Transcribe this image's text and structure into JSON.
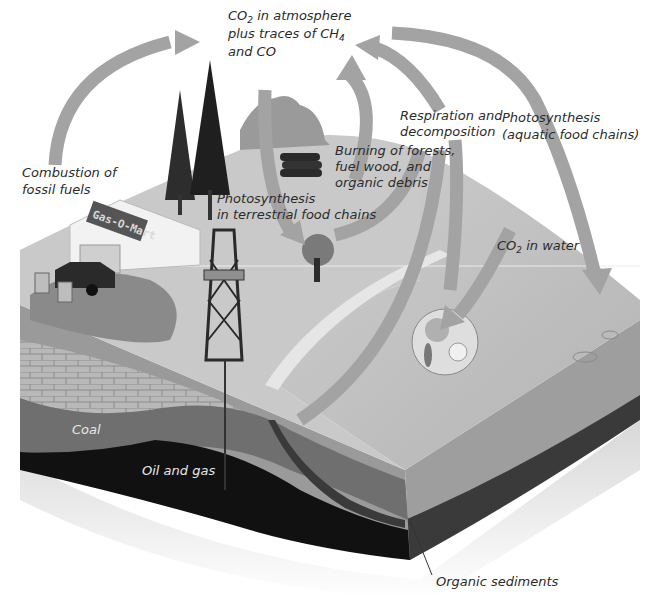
{
  "labels": {
    "atmosphere": {
      "line1_main": "CO",
      "line1_sub": "2",
      "line1_rest": " in atmosphere",
      "line2_main": "plus traces of CH",
      "line2_sub": "4",
      "line3": "and CO"
    },
    "combustion": {
      "line1": "Combustion of",
      "line2": "fossil fuels"
    },
    "burning": {
      "line1": "Burning of forests,",
      "line2": "fuel wood, and",
      "line3": "organic debris"
    },
    "respiration": {
      "line1": "Respiration and",
      "line2": "decomposition"
    },
    "photosynthesis_aquatic": {
      "line1": "Photosynthesis",
      "line2": "(aquatic food chains)"
    },
    "photosynthesis_terrestrial": {
      "line1": "Photosynthesis",
      "line2": "in terrestrial food chains"
    },
    "co2_water": {
      "main": "CO",
      "sub": "2",
      "rest": " in water"
    },
    "coal": "Coal",
    "oil_gas": "Oil and gas",
    "organic_sediments": "Organic sediments"
  },
  "store_sign": "Gas-O-Mart",
  "colors": {
    "arrow": "#a3a3a3",
    "land_top": "#c9c9c9",
    "water_top": "#bcbcbc",
    "soil": "#9a9a9a",
    "coal": "#6f6f6f",
    "oil_gas": "#111111",
    "sediment": "#3a3a3a"
  }
}
